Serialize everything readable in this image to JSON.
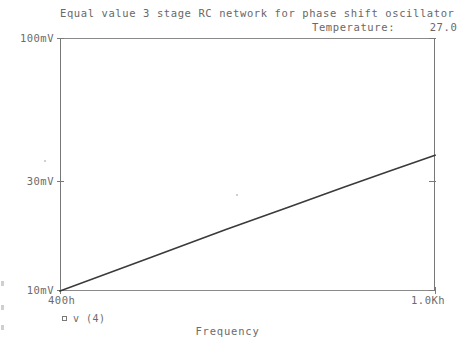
{
  "chart_data": {
    "type": "line",
    "title": "Equal value 3 stage RC network for phase shift oscillator",
    "subtitle": "Temperature:     27.0",
    "temperature_label": "Temperature:",
    "temperature_value": "27.0",
    "xlabel": "Frequency",
    "ylabel": "",
    "xscale": "log",
    "yscale": "log",
    "grid": false,
    "legend_position": "bottom-left",
    "xtick_labels": [
      "400h",
      "1.0Kh"
    ],
    "ytick_labels": [
      "100mV",
      "30mV",
      "10mV"
    ],
    "xlim": [
      400,
      1000
    ],
    "ylim": [
      10,
      100
    ],
    "xlim_units": "Hz",
    "ylim_units": "mV",
    "series": [
      {
        "name": "v (4)",
        "marker": "square",
        "color": "#3a3a3a",
        "x": [
          400,
          500,
          600,
          700,
          800,
          900,
          1000
        ],
        "y": [
          10.0,
          13.6,
          17.5,
          21.5,
          25.7,
          30.0,
          34.4
        ],
        "x_units": "Hz",
        "y_units": "mV"
      }
    ],
    "annotations": []
  },
  "axis": {
    "y_ticks": [
      {
        "label": "100mV",
        "value": 100
      },
      {
        "label": "30mV",
        "value": 30
      },
      {
        "label": "10mV",
        "value": 10
      }
    ],
    "x_ticks": [
      {
        "label": "400h",
        "value": 400
      },
      {
        "label": "1.0Kh",
        "value": 1000
      }
    ]
  },
  "legend": {
    "entries": [
      {
        "marker": "square-marker",
        "label": "v (4)"
      }
    ]
  },
  "colors": {
    "trace": "#3a3a3a",
    "axis": "#7a7a7a",
    "text": "#6b6b6b",
    "background": "#ffffff"
  }
}
